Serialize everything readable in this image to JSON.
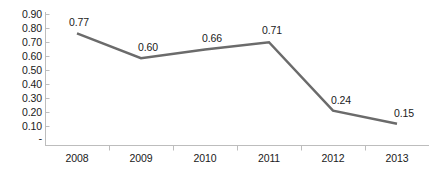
{
  "chart_data": {
    "type": "line",
    "title": "",
    "subtitle": "",
    "xlabel": "",
    "ylabel": "",
    "categories": [
      "2008",
      "2009",
      "2010",
      "2011",
      "2012",
      "2013"
    ],
    "values": [
      0.77,
      0.6,
      0.66,
      0.71,
      0.24,
      0.15
    ],
    "data_labels": [
      "0.77",
      "0.60",
      "0.66",
      "0.71",
      "0.24",
      "0.15"
    ],
    "series": [
      {
        "name": "",
        "values": [
          0.77,
          0.6,
          0.66,
          0.71,
          0.24,
          0.15
        ],
        "color": "#6b6b6b"
      }
    ],
    "ylim": [
      0,
      0.9
    ],
    "ytick_values": [
      0.9,
      0.8,
      0.7,
      0.6,
      0.5,
      0.4,
      0.3,
      0.2,
      0.1,
      0
    ],
    "ytick_labels": [
      "0.90",
      "0.80",
      "0.70",
      "0.60",
      "0.50",
      "0.40",
      "0.30",
      "0.20",
      "0.10",
      "-"
    ],
    "grid": false,
    "legend": false,
    "legend_position": "none",
    "markers": false,
    "annotations": []
  },
  "style": {
    "line_color": "#6b6b6b",
    "axis_color": "#bdbdbd",
    "tick_color": "#bdbdbd",
    "text_color": "#1a1a1a",
    "background": "#ffffff",
    "line_width": "2.5"
  }
}
